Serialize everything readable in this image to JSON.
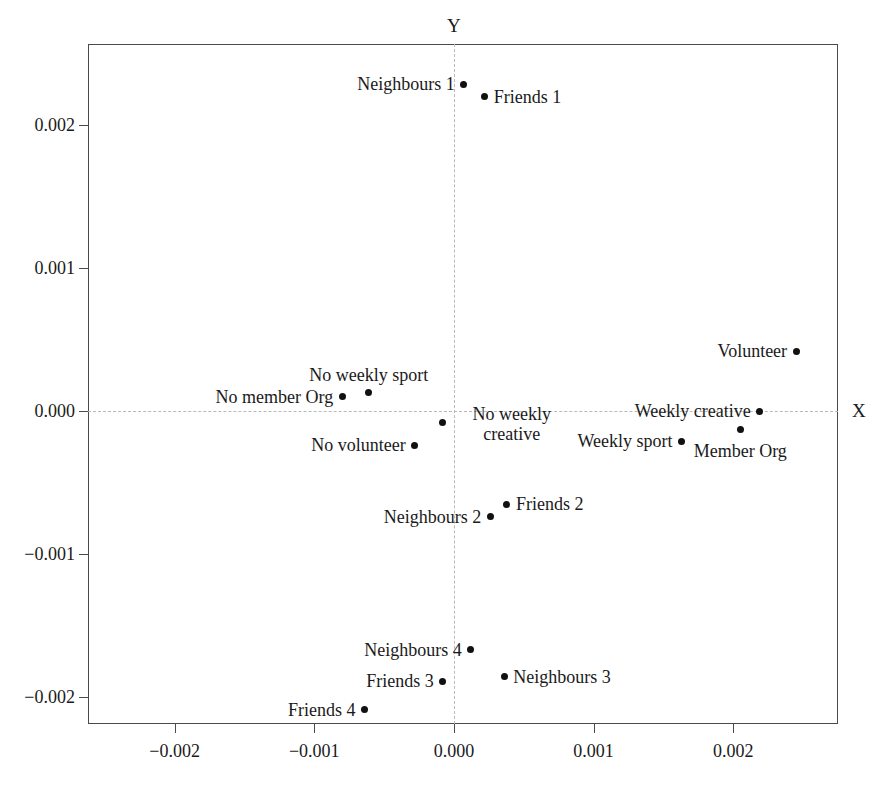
{
  "chart_data": {
    "type": "scatter",
    "title": "",
    "xlabel": "X",
    "ylabel": "Y",
    "xlim": [
      -0.00262,
      0.00275
    ],
    "ylim": [
      -0.00219,
      0.00257
    ],
    "grid": false,
    "legend": "none",
    "xticks": [
      -0.002,
      -0.001,
      0.0,
      0.001,
      0.002
    ],
    "yticks": [
      -0.002,
      -0.001,
      0.0,
      0.001,
      0.002
    ],
    "xticklabels": [
      "−0.002",
      "−0.001",
      "0.000",
      "0.001",
      "0.002"
    ],
    "yticklabels": [
      "−0.002",
      "−0.001",
      "0.000",
      "0.001",
      "0.002"
    ],
    "reference_lines": [
      {
        "axis": "y",
        "value": 0.0,
        "style": "dashed"
      },
      {
        "axis": "x",
        "value": 0.0,
        "style": "dashed"
      }
    ],
    "points": [
      {
        "label": "Neighbours 1",
        "x": 7e-05,
        "y": 0.00229,
        "label_pos": "left"
      },
      {
        "label": "Friends 1",
        "x": 0.00022,
        "y": 0.0022,
        "label_pos": "right"
      },
      {
        "label": "Volunteer",
        "x": 0.00245,
        "y": 0.00042,
        "label_pos": "left"
      },
      {
        "label": "No weekly sport",
        "x": -0.00061,
        "y": 0.00013,
        "label_pos": "above"
      },
      {
        "label": "No member Org",
        "x": -0.0008,
        "y": 0.0001,
        "label_pos": "left"
      },
      {
        "label": "Weekly creative",
        "x": 0.00219,
        "y": 0.0,
        "label_pos": "left"
      },
      {
        "label": "No weekly creative",
        "x": -8e-05,
        "y": -8e-05,
        "label_pos": "right"
      },
      {
        "label": "Member Org",
        "x": 0.00205,
        "y": -0.00013,
        "label_pos": "below"
      },
      {
        "label": "Weekly sport",
        "x": 0.00163,
        "y": -0.00021,
        "label_pos": "left"
      },
      {
        "label": "No volunteer",
        "x": -0.00028,
        "y": -0.00024,
        "label_pos": "left"
      },
      {
        "label": "Friends 2",
        "x": 0.00038,
        "y": -0.00065,
        "label_pos": "right"
      },
      {
        "label": "Neighbours 2",
        "x": 0.00026,
        "y": -0.00074,
        "label_pos": "left"
      },
      {
        "label": "Neighbours 4",
        "x": 0.00012,
        "y": -0.00167,
        "label_pos": "left"
      },
      {
        "label": "Neighbours 3",
        "x": 0.00036,
        "y": -0.00186,
        "label_pos": "right"
      },
      {
        "label": "Friends 3",
        "x": -8e-05,
        "y": -0.00189,
        "label_pos": "left"
      },
      {
        "label": "Friends 4",
        "x": -0.00064,
        "y": -0.00209,
        "label_pos": "left"
      }
    ]
  }
}
